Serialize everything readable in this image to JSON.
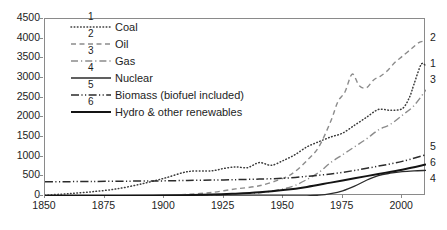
{
  "chart_data": {
    "type": "line",
    "title": "",
    "subtitle": "",
    "xlabel": "",
    "ylabel": "",
    "xlim": [
      1850,
      2010
    ],
    "ylim": [
      0,
      4500
    ],
    "xticks": [
      1850,
      1875,
      1900,
      1925,
      1950,
      1975,
      2000
    ],
    "yticks": [
      0,
      500,
      1000,
      1500,
      2000,
      2500,
      3000,
      3500,
      4000,
      4500
    ],
    "grid": false,
    "legend_position": "inside-top-left",
    "annotations": [
      "1",
      "2",
      "3",
      "4",
      "5",
      "6"
    ],
    "series": [
      {
        "name": "Coal",
        "number": "1",
        "style": "dotted",
        "end_label": "1",
        "x": [
          1850,
          1860,
          1870,
          1880,
          1890,
          1900,
          1910,
          1920,
          1925,
          1930,
          1935,
          1940,
          1945,
          1950,
          1955,
          1960,
          1965,
          1970,
          1975,
          1980,
          1985,
          1990,
          1995,
          2000,
          2003,
          2005,
          2008,
          2010
        ],
        "values": [
          20,
          60,
          110,
          180,
          300,
          450,
          620,
          640,
          700,
          740,
          720,
          850,
          780,
          900,
          1050,
          1250,
          1380,
          1500,
          1600,
          1800,
          2000,
          2200,
          2180,
          2220,
          2500,
          2850,
          3350,
          3300
        ]
      },
      {
        "name": "Oil",
        "number": "2",
        "style": "dashed",
        "end_label": "2",
        "x": [
          1850,
          1870,
          1890,
          1900,
          1910,
          1920,
          1930,
          1940,
          1950,
          1955,
          1960,
          1965,
          1970,
          1973,
          1976,
          1979,
          1982,
          1985,
          1988,
          1991,
          1994,
          1997,
          2000,
          2004,
          2007,
          2010
        ],
        "values": [
          0,
          2,
          8,
          20,
          45,
          90,
          180,
          260,
          450,
          620,
          900,
          1250,
          1900,
          2400,
          2650,
          3100,
          2800,
          2750,
          2950,
          3050,
          3200,
          3400,
          3550,
          3750,
          3900,
          3950
        ]
      },
      {
        "name": "Gas",
        "number": "3",
        "style": "dashdot",
        "end_label": "3",
        "x": [
          1850,
          1880,
          1900,
          1920,
          1930,
          1940,
          1950,
          1955,
          1960,
          1965,
          1970,
          1975,
          1980,
          1985,
          1990,
          1995,
          2000,
          2005,
          2010
        ],
        "values": [
          0,
          2,
          8,
          25,
          45,
          80,
          180,
          270,
          420,
          600,
          850,
          1050,
          1250,
          1450,
          1680,
          1820,
          2050,
          2300,
          2700
        ]
      },
      {
        "name": "Nuclear",
        "number": "4",
        "style": "solid-thin",
        "end_label": "4",
        "x": [
          1850,
          1950,
          1960,
          1965,
          1970,
          1975,
          1980,
          1985,
          1990,
          1995,
          2000,
          2005,
          2010
        ],
        "values": [
          0,
          0,
          5,
          20,
          60,
          130,
          250,
          400,
          520,
          580,
          620,
          640,
          650
        ]
      },
      {
        "name": "Biomass (biofuel included)",
        "number": "5",
        "style": "dashdotdot",
        "end_label": "5",
        "x": [
          1850,
          1870,
          1890,
          1900,
          1910,
          1920,
          1930,
          1940,
          1950,
          1960,
          1970,
          1980,
          1990,
          2000,
          2010
        ],
        "values": [
          360,
          370,
          380,
          385,
          395,
          405,
          415,
          430,
          450,
          500,
          560,
          650,
          760,
          880,
          1050
        ]
      },
      {
        "name": "Hydro & other renewables",
        "number": "6",
        "style": "solid-thick",
        "end_label": "6",
        "x": [
          1850,
          1880,
          1900,
          1920,
          1930,
          1940,
          1950,
          1960,
          1970,
          1980,
          1990,
          2000,
          2010
        ],
        "values": [
          0,
          3,
          12,
          35,
          60,
          95,
          150,
          230,
          340,
          450,
          560,
          670,
          800
        ]
      }
    ]
  },
  "axes": {
    "y_tick_labels": [
      "4500",
      "4000",
      "3500",
      "3000",
      "2500",
      "2000",
      "1500",
      "1000",
      "500",
      "0"
    ],
    "x_tick_labels": [
      "1850",
      "1875",
      "1900",
      "1925",
      "1950",
      "1975",
      "2000"
    ]
  },
  "legend": {
    "items": [
      {
        "number": "1",
        "label": "Coal"
      },
      {
        "number": "2",
        "label": "Oil"
      },
      {
        "number": "3",
        "label": "Gas"
      },
      {
        "number": "4",
        "label": "Nuclear"
      },
      {
        "number": "5",
        "label": "Biomass (biofuel included)"
      },
      {
        "number": "6",
        "label": "Hydro & other renewables"
      }
    ]
  },
  "end_labels": [
    {
      "text": "2",
      "top": 31
    },
    {
      "text": "1",
      "top": 57
    },
    {
      "text": "3",
      "top": 73
    },
    {
      "text": "5",
      "top": 140
    },
    {
      "text": "6",
      "top": 156
    },
    {
      "text": "4",
      "top": 172
    }
  ],
  "colors": {
    "axis": "#8a8a8a",
    "text": "#1d1d1d",
    "coal": "#3a3a3a",
    "oil": "#8c8c8c",
    "gas": "#8c8c8c",
    "nuclear": "#2b2b2b",
    "biomass": "#2b2b2b",
    "hydro": "#141414",
    "background": "#ffffff"
  }
}
